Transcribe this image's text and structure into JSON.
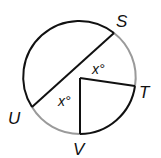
{
  "diagram": {
    "type": "circle-geometry",
    "circle": {
      "cx": 80,
      "cy": 78,
      "r": 56
    },
    "points": {
      "S": {
        "label": "S",
        "x": 114,
        "y": 33
      },
      "T": {
        "label": "T",
        "x": 135,
        "y": 86
      },
      "U": {
        "label": "U",
        "x": 32,
        "y": 107
      },
      "V": {
        "label": "V",
        "x": 80,
        "y": 134
      }
    },
    "angle_labels": [
      {
        "text": "x°",
        "between": "S-T"
      },
      {
        "text": "x°",
        "between": "U-V"
      }
    ],
    "highlighted_arcs": [
      "ST",
      "UV"
    ],
    "colors": {
      "stroke": "#111111",
      "highlight_arc": "#9a9a9a"
    }
  },
  "labels": {
    "S": "S",
    "T": "T",
    "U": "U",
    "V": "V",
    "angle1": "x°",
    "angle2": "x°"
  }
}
